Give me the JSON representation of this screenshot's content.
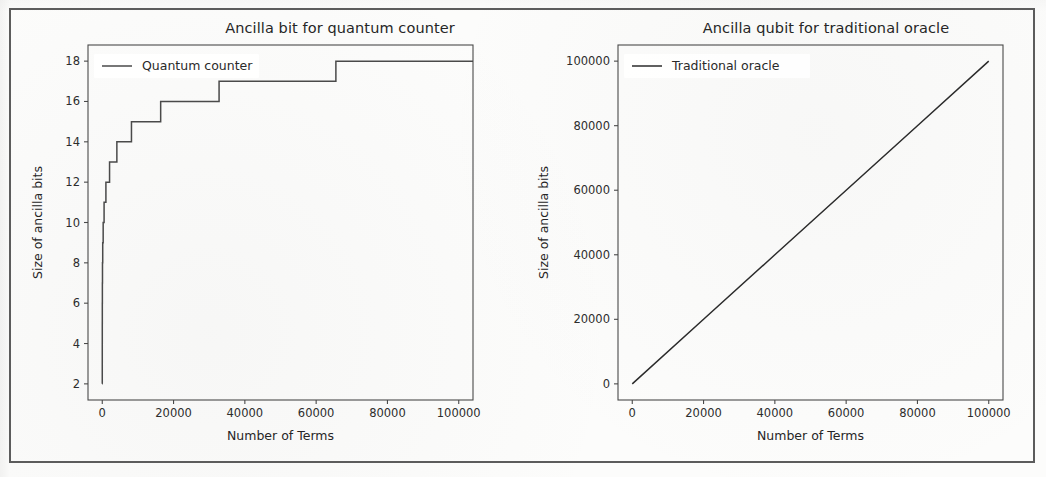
{
  "page": {
    "background_color": "#fcfcfb",
    "border_color": "#5c5c5c"
  },
  "charts": [
    {
      "id": "quantum-counter",
      "title": "Ancilla bit for quantum counter",
      "xlabel": "Number of Terms",
      "ylabel": "Size of ancilla bits",
      "legend_label": "Quantum counter",
      "line_color": "#4a4a4a"
    },
    {
      "id": "traditional-oracle",
      "title": "Ancilla qubit for traditional oracle",
      "xlabel": "Number of Terms",
      "ylabel": "Size of ancilla bits",
      "legend_label": "Traditional oracle",
      "line_color": "#2b2b2b"
    }
  ],
  "chart_data": [
    {
      "type": "line",
      "id": "quantum-counter",
      "title": "Ancilla bit for quantum counter",
      "xlabel": "Number of Terms",
      "ylabel": "Size of ancilla bits",
      "xlim": [
        -4000,
        104000
      ],
      "ylim": [
        1.2,
        18.8
      ],
      "xticks": [
        0,
        20000,
        40000,
        60000,
        80000,
        100000
      ],
      "xticklabels": [
        "0",
        "20000",
        "40000",
        "60000",
        "80000",
        "100000"
      ],
      "yticks": [
        2,
        4,
        6,
        8,
        10,
        12,
        14,
        16,
        18
      ],
      "yticklabels": [
        "2",
        "4",
        "6",
        "8",
        "10",
        "12",
        "14",
        "16",
        "18"
      ],
      "grid": false,
      "legend": {
        "entries": [
          "Quantum counter"
        ],
        "position": "upper left"
      },
      "series": [
        {
          "name": "Quantum counter",
          "style": "step-post",
          "color": "#4a4a4a",
          "x": [
            1,
            2,
            4,
            8,
            16,
            32,
            64,
            128,
            256,
            512,
            1024,
            2048,
            4096,
            8192,
            16384,
            32768,
            65536,
            100000
          ],
          "y": [
            2,
            3,
            4,
            5,
            6,
            7,
            8,
            9,
            10,
            11,
            12,
            13,
            14,
            15,
            16,
            17,
            18,
            18
          ]
        }
      ],
      "annotations": [
        "Step function: ancilla bits grow as ceil(log2(number of terms)) + 1",
        "Plateaus at 18 bits from 65536 terms to 100000 terms"
      ]
    },
    {
      "type": "line",
      "id": "traditional-oracle",
      "title": "Ancilla qubit for traditional oracle",
      "xlabel": "Number of Terms",
      "ylabel": "Size of ancilla bits",
      "xlim": [
        -4000,
        104000
      ],
      "ylim": [
        -5000,
        105000
      ],
      "xticks": [
        0,
        20000,
        40000,
        60000,
        80000,
        100000
      ],
      "xticklabels": [
        "0",
        "20000",
        "40000",
        "60000",
        "80000",
        "100000"
      ],
      "yticks": [
        0,
        20000,
        40000,
        60000,
        80000,
        100000
      ],
      "yticklabels": [
        "0",
        "20000",
        "40000",
        "60000",
        "80000",
        "100000"
      ],
      "grid": false,
      "legend": {
        "entries": [
          "Traditional oracle"
        ],
        "position": "upper left"
      },
      "series": [
        {
          "name": "Traditional oracle",
          "style": "linear",
          "color": "#2b2b2b",
          "x": [
            0,
            20000,
            40000,
            60000,
            80000,
            100000
          ],
          "y": [
            0,
            20000,
            40000,
            60000,
            80000,
            100000
          ]
        }
      ],
      "annotations": [
        "Linear growth: ancilla bits equal the number of terms (slope 1)"
      ]
    }
  ]
}
